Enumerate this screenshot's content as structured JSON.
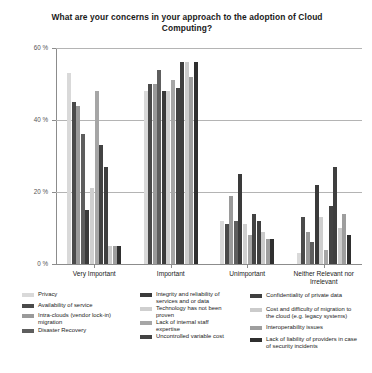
{
  "chart_data": {
    "type": "bar",
    "title": "What are your concerns in your approach to the adoption of Cloud Computing?",
    "xlabel": "",
    "ylabel": "",
    "ylim": [
      0,
      60
    ],
    "yticks": [
      "0 %",
      "20 %",
      "40 %",
      "60 %"
    ],
    "ytick_values": [
      0,
      20,
      40,
      60
    ],
    "grid": true,
    "legend_position": "bottom",
    "categories": [
      "Very Important",
      "Important",
      "Unimportant",
      "Neither Relevant nor Irrelevant"
    ],
    "series": [
      {
        "name": "Privacy",
        "color": "#d9d9d9",
        "values": [
          53,
          48,
          12,
          3
        ]
      },
      {
        "name": "Availability of service",
        "color": "#4a4a4a",
        "values": [
          45,
          50,
          11,
          13
        ]
      },
      {
        "name": "Intra-clouds (vendor lock-in) migration",
        "color": "#9a9a9a",
        "values": [
          44,
          50,
          19,
          9
        ]
      },
      {
        "name": "Disaster Recovery",
        "color": "#5e5e5e",
        "values": [
          36,
          54,
          12,
          6
        ]
      },
      {
        "name": "Integrity and reliability of services and or data",
        "color": "#3a3a3a",
        "values": [
          15,
          48,
          25,
          22
        ]
      },
      {
        "name": "Technology has not been proven",
        "color": "#cfcfcf",
        "values": [
          21,
          48,
          11,
          13
        ]
      },
      {
        "name": "Lack of internal staff expertise",
        "color": "#a6a6a6",
        "values": [
          48,
          51,
          8,
          4
        ]
      },
      {
        "name": "Uncontrolled variable cost",
        "color": "#434343",
        "values": [
          33,
          49,
          14,
          16
        ]
      },
      {
        "name": "Confidentiality of private data",
        "color": "#3f3f3f",
        "values": [
          27,
          56,
          12,
          27
        ]
      },
      {
        "name": "Cost and difficulty of migration to the cloud (e.g. legacy systems)",
        "color": "#cbcbcb",
        "values": [
          5,
          56,
          9,
          10
        ]
      },
      {
        "name": "Interoperability issues",
        "color": "#9e9e9e",
        "values": [
          5,
          52,
          7,
          14
        ]
      },
      {
        "name": "Lack of liability of providers in case of security incidents",
        "color": "#2f2f2f",
        "values": [
          5,
          56,
          7,
          8
        ]
      }
    ]
  },
  "legend": {
    "columns": [
      {
        "items": [
          {
            "label": "Privacy",
            "color": "#d9d9d9"
          },
          {
            "label": "Availability of service",
            "color": "#4a4a4a"
          },
          {
            "label": "Intra-clouds (vendor lock-in) migration",
            "color": "#9a9a9a"
          },
          {
            "label": "Disaster Recovery",
            "color": "#5e5e5e"
          }
        ]
      },
      {
        "items": [
          {
            "label": "Integrity and reliability of services and or data",
            "color": "#3a3a3a"
          },
          {
            "label": "Technology has not been proven",
            "color": "#cfcfcf"
          },
          {
            "label": "Lack of internal staff expertise",
            "color": "#a6a6a6"
          },
          {
            "label": "Uncontrolled variable cost",
            "color": "#434343"
          }
        ]
      },
      {
        "items": [
          {
            "label": "Confidentiality of private data",
            "color": "#3f3f3f"
          },
          {
            "label": "Cost and difficulty of migration to the cloud (e.g. legacy systems)",
            "color": "#cbcbcb"
          },
          {
            "label": "Interoperability issues",
            "color": "#9e9e9e"
          },
          {
            "label": "Lack of liability of providers in case of security incidents",
            "color": "#2f2f2f"
          }
        ]
      }
    ]
  }
}
